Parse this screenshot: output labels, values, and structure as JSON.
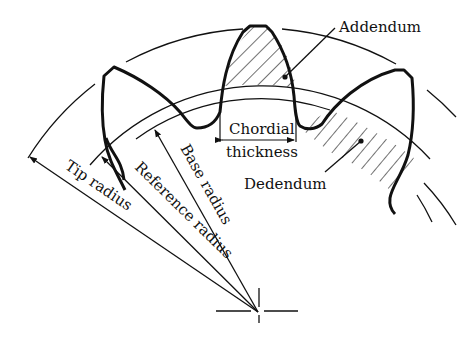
{
  "diagram": {
    "type": "gear-tooth-nomenclature",
    "colors": {
      "line": "#111111",
      "background": "#ffffff"
    },
    "labels": {
      "addendum": "Addendum",
      "dedendum": "Dedendum",
      "chordial": "Chordial",
      "thickness": "thickness",
      "tip_radius": "Tip radius",
      "reference_radius": "Reference radius",
      "base_radius": "Base radius"
    },
    "elements": {
      "center_mark": "center-crosshair",
      "circles": [
        "tip circle",
        "reference circle",
        "base circle"
      ],
      "teeth": 3,
      "hatched_regions": [
        "addendum",
        "dedendum"
      ]
    }
  }
}
